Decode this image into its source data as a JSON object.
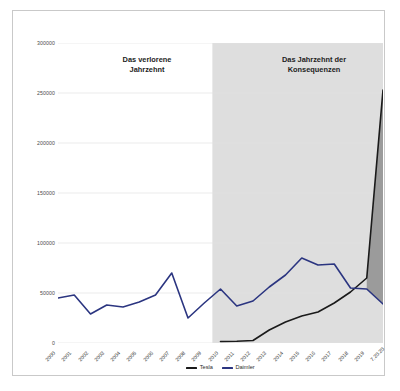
{
  "chart_data": {
    "type": "line",
    "title": "",
    "xlabel": "",
    "ylabel": "",
    "ylim": [
      0,
      300000
    ],
    "grid": true,
    "legend_position": "bottom-center",
    "categories": [
      "2000",
      "2001",
      "2002",
      "2003",
      "2004",
      "2005",
      "2006",
      "2007",
      "2008",
      "2009",
      "2010",
      "2011",
      "2012",
      "2013",
      "2014",
      "2015",
      "2016",
      "2017",
      "2018",
      "2019",
      "7.20.20"
    ],
    "yticks": [
      "0",
      "50000",
      "100000",
      "150000",
      "200000",
      "250000",
      "300000"
    ],
    "ytick_values": [
      0,
      50000,
      100000,
      150000,
      200000,
      250000,
      300000
    ],
    "series": [
      {
        "name": "Tesla",
        "color": "#1a1a1a",
        "values": [
          null,
          null,
          null,
          null,
          null,
          null,
          null,
          null,
          null,
          null,
          1500,
          1800,
          2500,
          13000,
          21000,
          27000,
          31000,
          40000,
          51000,
          65000,
          253000
        ]
      },
      {
        "name": "Daimler",
        "color": "#2b3580",
        "values": [
          45000,
          48000,
          29000,
          38000,
          36000,
          41000,
          48000,
          70000,
          25000,
          40000,
          54000,
          37000,
          42000,
          56000,
          68000,
          85000,
          78000,
          79000,
          55000,
          54000,
          39000
        ]
      }
    ],
    "annotations": [
      {
        "id": "left",
        "text": "Das verlorene\nJahrzehnt",
        "x_range": [
          "2000",
          "2009"
        ]
      },
      {
        "id": "right",
        "text": "Das Jahrzehnt der\nKonsequenzen",
        "x_range": [
          "2010",
          "7.20.20"
        ]
      }
    ],
    "shaded_band": {
      "label": "Das Jahrzehnt der Konsequenzen",
      "from": "2010",
      "to": "7.20.20",
      "color": "#dedede"
    },
    "area_fill": {
      "between": [
        "Tesla",
        "Daimler"
      ],
      "color": "#8f8f8f",
      "from": "2019",
      "to": "7.20.20"
    }
  },
  "legend": {
    "items": [
      {
        "label": "Tesla",
        "color": "#1a1a1a"
      },
      {
        "label": "Daimler",
        "color": "#2b3580"
      }
    ]
  },
  "colors": {
    "tesla": "#1a1a1a",
    "daimler": "#2b3580",
    "band": "#dedede",
    "grid": "#e2e2e2",
    "frame": "#c9c9c9",
    "fill": "#8f8f8f"
  }
}
